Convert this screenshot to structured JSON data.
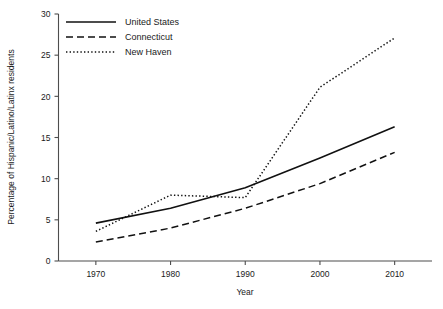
{
  "chart_data": {
    "type": "line",
    "title": "",
    "xlabel": "Year",
    "ylabel": "Percentage of Hispanic/Latino/Latinx residents",
    "x": [
      1970,
      1980,
      1990,
      2000,
      2010
    ],
    "xtick_labels": [
      "1970",
      "1980",
      "1990",
      "2000",
      "2010"
    ],
    "ytick_labels": [
      "0",
      "5",
      "10",
      "15",
      "20",
      "25",
      "30"
    ],
    "yticks": [
      0,
      5,
      10,
      15,
      20,
      25,
      30
    ],
    "xlim": [
      1965,
      2015
    ],
    "ylim": [
      0,
      30
    ],
    "grid": false,
    "legend_position": "top-left",
    "series": [
      {
        "name": "United States",
        "style": "solid",
        "color": "#111111",
        "values": [
          4.6,
          6.4,
          8.9,
          12.5,
          16.3
        ]
      },
      {
        "name": "Connecticut",
        "style": "dashed",
        "color": "#111111",
        "values": [
          2.3,
          4.0,
          6.4,
          9.4,
          13.2
        ]
      },
      {
        "name": "New Haven",
        "style": "dotted",
        "color": "#111111",
        "values": [
          3.6,
          8.0,
          7.7,
          21.1,
          27.1
        ]
      }
    ]
  },
  "legend": {
    "entries": [
      {
        "label": "United States"
      },
      {
        "label": "Connecticut"
      },
      {
        "label": "New Haven"
      }
    ]
  }
}
